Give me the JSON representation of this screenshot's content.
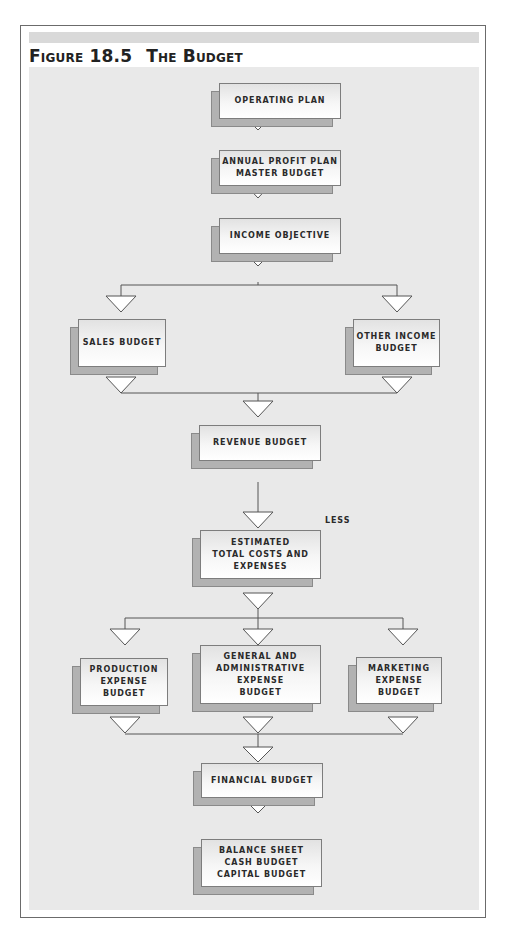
{
  "figure": {
    "number": "Figure 18.5",
    "title": "The Budget"
  },
  "nodes": {
    "operating_plan": {
      "lines": [
        "Operating Plan"
      ]
    },
    "annual_profit_plan": {
      "lines": [
        "Annual Profit Plan",
        "Master Budget"
      ]
    },
    "income_objective": {
      "lines": [
        "Income Objective"
      ]
    },
    "sales_budget": {
      "lines": [
        "Sales Budget"
      ]
    },
    "other_income_budget": {
      "lines": [
        "Other Income",
        "Budget"
      ]
    },
    "revenue_budget": {
      "lines": [
        "Revenue Budget"
      ]
    },
    "estimated_costs": {
      "lines": [
        "Estimated",
        "Total Costs and",
        "Expenses"
      ]
    },
    "production_expense": {
      "lines": [
        "Production",
        "Expense",
        "Budget"
      ]
    },
    "ga_expense": {
      "lines": [
        "General and",
        "Administrative",
        "Expense",
        "Budget"
      ]
    },
    "marketing_expense": {
      "lines": [
        "Marketing",
        "Expense",
        "Budget"
      ]
    },
    "financial_budget": {
      "lines": [
        "Financial Budget"
      ]
    },
    "balance_sheet": {
      "lines": [
        "Balance Sheet",
        "Cash Budget",
        "Capital Budget"
      ]
    }
  },
  "annotations": {
    "less_label": "Less"
  },
  "flow": [
    [
      "operating_plan",
      "annual_profit_plan"
    ],
    [
      "annual_profit_plan",
      "income_objective"
    ],
    [
      "income_objective",
      "sales_budget"
    ],
    [
      "income_objective",
      "other_income_budget"
    ],
    [
      "sales_budget",
      "revenue_budget"
    ],
    [
      "other_income_budget",
      "revenue_budget"
    ],
    [
      "revenue_budget",
      "estimated_costs"
    ],
    [
      "estimated_costs",
      "production_expense"
    ],
    [
      "estimated_costs",
      "ga_expense"
    ],
    [
      "estimated_costs",
      "marketing_expense"
    ],
    [
      "production_expense",
      "financial_budget"
    ],
    [
      "ga_expense",
      "financial_budget"
    ],
    [
      "marketing_expense",
      "financial_budget"
    ],
    [
      "financial_budget",
      "balance_sheet"
    ]
  ],
  "colors": {
    "background": "#e9e9e9",
    "box_shadow": "#b2b2b2",
    "line": "#555555",
    "arrow_fill": "#ffffff"
  }
}
